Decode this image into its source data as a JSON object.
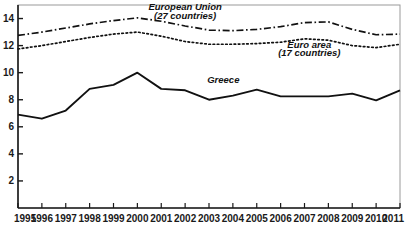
{
  "chart_data": {
    "type": "line",
    "title": "",
    "xlabel": "",
    "ylabel": "",
    "x": [
      1995,
      1996,
      1997,
      1998,
      1999,
      2000,
      2001,
      2002,
      2003,
      2004,
      2005,
      2006,
      2007,
      2008,
      2009,
      2010,
      2011
    ],
    "xtick_labels": [
      "1995",
      "1996",
      "1997",
      "1998",
      "1999",
      "2000",
      "2001",
      "2002",
      "2003",
      "2004",
      "2005",
      "2006",
      "2007",
      "2008",
      "2009",
      "2010",
      "2011"
    ],
    "ytick_labels": [
      "2",
      "4",
      "6",
      "8",
      "10",
      "12",
      "14"
    ],
    "yticks": [
      2,
      4,
      6,
      8,
      10,
      12,
      14
    ],
    "ylim": [
      0,
      15
    ],
    "xlim": [
      1995,
      2011
    ],
    "grid": false,
    "legend_position": "inline-annotations",
    "series": [
      {
        "name": "European Union",
        "sublabel": "(27 countries)",
        "label_line1": "European Union",
        "label_line2": "(27 countries)",
        "style": "dash-dot",
        "color": "#111111",
        "values": [
          12.75,
          13.0,
          13.3,
          13.6,
          13.85,
          14.05,
          13.8,
          13.45,
          13.15,
          13.1,
          13.2,
          13.4,
          13.7,
          13.75,
          13.2,
          12.8,
          12.85
        ]
      },
      {
        "name": "Euro area",
        "sublabel": "(17 countries)",
        "label_line1": "Euro area",
        "label_line2": "(17 countries)",
        "style": "dotted",
        "color": "#111111",
        "values": [
          11.75,
          12.0,
          12.3,
          12.6,
          12.85,
          13.0,
          12.7,
          12.3,
          12.1,
          12.1,
          12.15,
          12.25,
          12.5,
          12.4,
          12.0,
          11.85,
          12.1
        ]
      },
      {
        "name": "Greece",
        "sublabel": "",
        "label_line1": "Greece",
        "label_line2": "",
        "style": "solid",
        "color": "#111111",
        "values": [
          6.9,
          6.6,
          7.2,
          8.8,
          9.1,
          10.0,
          8.8,
          8.7,
          8.0,
          8.3,
          8.75,
          8.25,
          8.25,
          8.25,
          8.45,
          7.95,
          8.7
        ]
      }
    ],
    "annotations": [
      {
        "text": "European Union",
        "series": "European Union",
        "x": 2002,
        "y": 14.65
      },
      {
        "text": "(27 countries)",
        "series": "European Union",
        "x": 2002,
        "y": 14.0
      },
      {
        "text": "Euro area",
        "series": "Euro area",
        "x": 2007.2,
        "y": 11.85
      },
      {
        "text": "(17 countries)",
        "series": "Euro area",
        "x": 2007.2,
        "y": 11.2
      },
      {
        "text": "Greece",
        "series": "Greece",
        "x": 2003.6,
        "y": 9.25
      }
    ],
    "colors": {
      "axis": "#1a1a1a",
      "frame": "#9a9a9a",
      "line": "#111111",
      "background": "#ffffff"
    }
  }
}
